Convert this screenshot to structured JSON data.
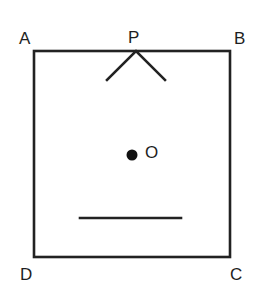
{
  "diagram": {
    "type": "geometry-figure",
    "colors": {
      "background": "#ffffff",
      "line": "#222222",
      "text": "#1e1e1e"
    },
    "labels": {
      "A": "A",
      "B": "B",
      "C": "C",
      "D": "D",
      "P": "P",
      "O": "O"
    },
    "square": {
      "corners": {
        "A": [
          34,
          51
        ],
        "B": [
          230,
          51
        ],
        "C": [
          230,
          257
        ],
        "D": [
          34,
          257
        ]
      }
    },
    "point_P": {
      "position": [
        136,
        51
      ],
      "v_arm_left_end": [
        107,
        80
      ],
      "v_arm_right_end": [
        165,
        80
      ]
    },
    "point_O": {
      "position": [
        132,
        155
      ],
      "radius": 5
    },
    "segment": {
      "start": [
        80,
        218
      ],
      "end": [
        181,
        218
      ]
    }
  }
}
